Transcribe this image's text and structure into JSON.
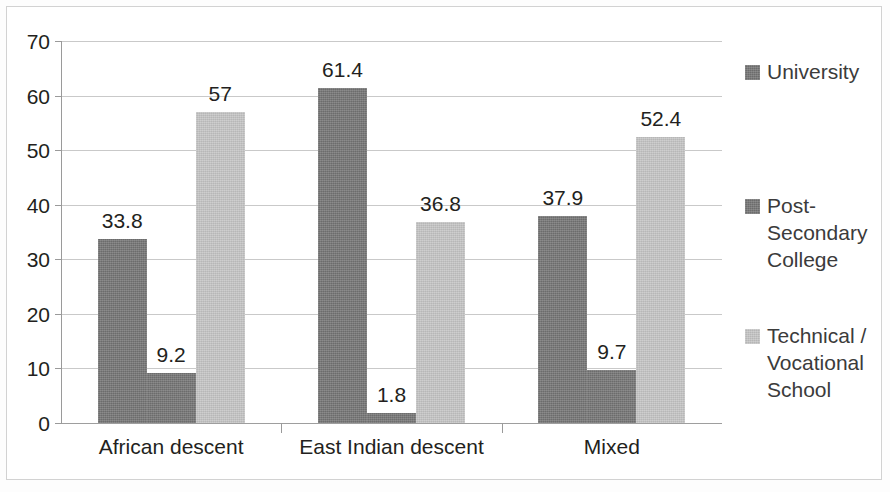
{
  "chart_data": {
    "type": "bar",
    "title": "",
    "subtitle": "",
    "xlabel": "",
    "ylabel": "",
    "categories": [
      "African descent",
      "East Indian descent",
      "Mixed"
    ],
    "series": [
      {
        "name": "University",
        "color": "#757575",
        "values": [
          33.8,
          61.4,
          37.9
        ],
        "labels": [
          "33.8",
          "61.4",
          "37.9"
        ]
      },
      {
        "name": "Post-Secondary College",
        "color": "#757575",
        "values": [
          9.2,
          1.8,
          9.7
        ],
        "labels": [
          "9.2",
          "1.8",
          "9.7"
        ]
      },
      {
        "name": "Technical / Vocational School",
        "color": "#c5c5c5",
        "values": [
          57,
          36.8,
          52.4
        ],
        "labels": [
          "57",
          "36.8",
          "52.4"
        ]
      }
    ],
    "ylim": [
      0,
      70
    ],
    "ytick_step": 10,
    "ytick_labels": [
      "0",
      "10",
      "20",
      "30",
      "40",
      "50",
      "60",
      "70"
    ],
    "grid": true,
    "legend_position": "right",
    "legend_entries": [
      {
        "label": "University",
        "lines": [
          "University"
        ],
        "color": "#757575"
      },
      {
        "label": "Post-Secondary College",
        "lines": [
          "Post-",
          "Secondary",
          "College"
        ],
        "color": "#757575"
      },
      {
        "label": "Technical / Vocational School",
        "lines": [
          "Technical /",
          "Vocational",
          "School"
        ],
        "color": "#c5c5c5"
      }
    ]
  },
  "legend": {
    "entries": [
      {
        "text": "University"
      },
      {
        "text": "Post-\nSecondary\nCollege"
      },
      {
        "text": "Technical /\nVocational\nSchool"
      }
    ]
  }
}
